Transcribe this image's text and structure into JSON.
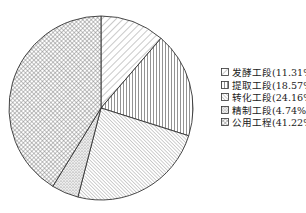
{
  "chart_data": {
    "type": "pie",
    "title": "",
    "start_angle": "top",
    "direction": "clockwise",
    "legend_position": "right",
    "categories": [
      "发酵工段",
      "提取工段",
      "转化工段",
      "精制工段",
      "公用工程"
    ],
    "values": [
      11.31,
      18.57,
      24.16,
      4.74,
      41.22
    ],
    "unit": "%",
    "patterns": [
      "diagonal-hatch",
      "vertical-lines",
      "dense-diagonal-hatch",
      "dots",
      "crosshatch"
    ]
  },
  "legend": {
    "items": [
      {
        "label": "发酵工段(11.31%)"
      },
      {
        "label": "提取工段(18.57%)"
      },
      {
        "label": "转化工段(24.16%)"
      },
      {
        "label": "精制工段(4.74%)"
      },
      {
        "label": "公用工程(41.22%)"
      }
    ]
  }
}
